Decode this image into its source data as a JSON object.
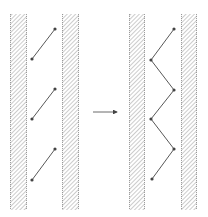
{
  "diagram": {
    "colors": {
      "stroke": "#444444",
      "hatch": "#9a9a9a",
      "background": "#ffffff"
    },
    "left_panel": {
      "walls": [
        {
          "x": 10,
          "y": 14,
          "w": 17,
          "h": 196
        },
        {
          "x": 62,
          "y": 14,
          "w": 17,
          "h": 196
        }
      ],
      "links": [
        {
          "x1": 32,
          "y1": 59,
          "x2": 55,
          "y2": 29
        },
        {
          "x1": 32,
          "y1": 119,
          "x2": 55,
          "y2": 89
        },
        {
          "x1": 32,
          "y1": 180,
          "x2": 55,
          "y2": 149
        }
      ]
    },
    "arrow": {
      "x1": 93,
      "y1": 112,
      "x2": 117,
      "y2": 112
    },
    "right_panel": {
      "walls": [
        {
          "x": 129,
          "y": 14,
          "w": 16,
          "h": 196
        },
        {
          "x": 181,
          "y": 14,
          "w": 16,
          "h": 196
        }
      ],
      "zigzag_points": [
        [
          174,
          29
        ],
        [
          151,
          60
        ],
        [
          174,
          90
        ],
        [
          151,
          119
        ],
        [
          174,
          149
        ],
        [
          152,
          179
        ]
      ]
    }
  }
}
